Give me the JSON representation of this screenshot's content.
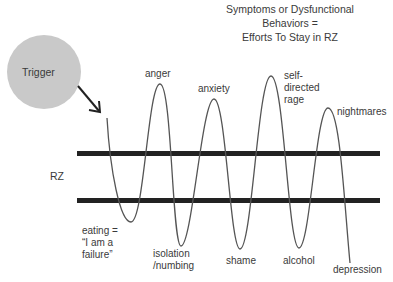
{
  "title": {
    "line1": "Symptoms or Dysfunctional",
    "line2": "Behaviors =",
    "line3": "Efforts To Stay in RZ"
  },
  "trigger": {
    "label": "Trigger",
    "fill": "#c9c9c9"
  },
  "zone": {
    "label": "RZ",
    "bar_color": "#222222"
  },
  "wave_color": "#555555",
  "peaks": [
    {
      "id": "anger",
      "label": "anger"
    },
    {
      "id": "anxiety",
      "label": "anxiety"
    },
    {
      "id": "self-directed-rage",
      "line1": "self-",
      "line2": "directed",
      "line3": "rage"
    },
    {
      "id": "nightmares",
      "label": "nightmares"
    }
  ],
  "troughs": [
    {
      "id": "eating",
      "line1": "eating =",
      "line2": "“I am a",
      "line3": "failure”"
    },
    {
      "id": "isolation",
      "line1": "isolation",
      "line2": "/numbing"
    },
    {
      "id": "shame",
      "label": "shame"
    },
    {
      "id": "alcohol",
      "label": "alcohol"
    },
    {
      "id": "depression",
      "label": "depression"
    }
  ]
}
